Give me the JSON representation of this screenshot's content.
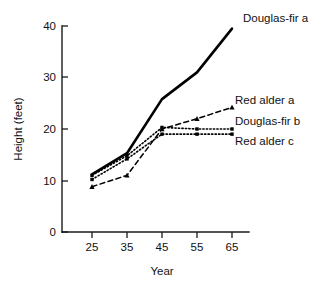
{
  "chart_data": {
    "type": "line",
    "title": "",
    "xlabel": "Year",
    "ylabel": "Height (feet)",
    "x": [
      25,
      35,
      45,
      55,
      65
    ],
    "xticklabels": [
      "25",
      "35",
      "45",
      "55",
      "65"
    ],
    "yticks": [
      0,
      10,
      20,
      30,
      40
    ],
    "yticklabels": [
      "0",
      "10",
      "20",
      "30",
      "40"
    ],
    "xlim": [
      20,
      70
    ],
    "ylim": [
      0,
      40
    ],
    "grid": false,
    "legend_position": "right-inline-labels",
    "series": [
      {
        "name": "Douglas-fir a",
        "style": "solid",
        "marker": "none",
        "values": [
          11.2,
          15.3,
          25.8,
          31.0,
          39.5
        ],
        "label": "Douglas-fir a"
      },
      {
        "name": "Douglas-fir b",
        "style": "dotted",
        "marker": "square",
        "values": [
          11.0,
          14.8,
          20.3,
          20.0,
          20.0
        ],
        "label": "Douglas-fir b"
      },
      {
        "name": "Red alder c",
        "style": "dotted",
        "marker": "square",
        "values": [
          10.2,
          14.2,
          19.0,
          19.0,
          19.0
        ],
        "label": "Red alder c"
      },
      {
        "name": "Red alder a",
        "style": "dashed",
        "marker": "triangle",
        "values": [
          8.8,
          11.0,
          20.0,
          22.0,
          24.2
        ],
        "label": "Red alder a"
      }
    ],
    "colors": {
      "ink": "#000000",
      "axis": "#1a1a1a",
      "background": "#ffffff"
    }
  }
}
